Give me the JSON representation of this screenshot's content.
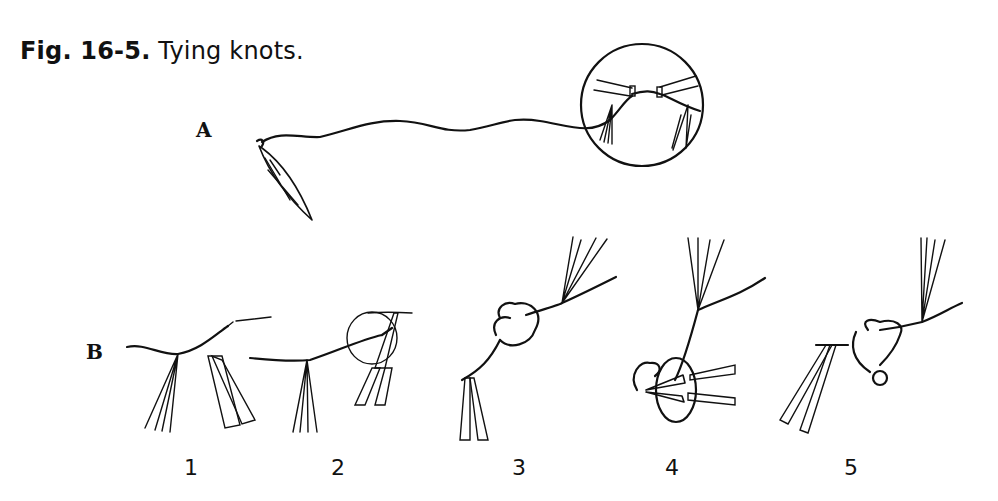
{
  "figure": {
    "caption_bold": "Fig. 16-5.",
    "caption_text": " Tying knots."
  },
  "panels": {
    "A": {
      "label": "A"
    },
    "B": {
      "label": "B",
      "steps": [
        "1",
        "2",
        "3",
        "4",
        "5"
      ]
    }
  }
}
